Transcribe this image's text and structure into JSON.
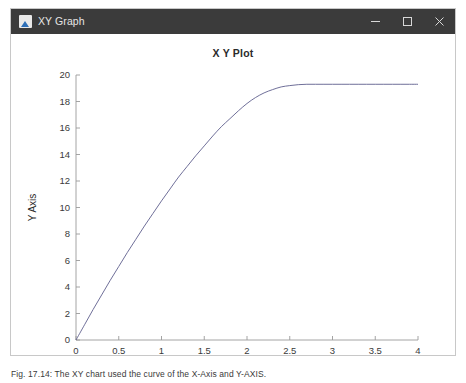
{
  "window": {
    "title": "XY Graph",
    "icon": "xy-graph-app-icon",
    "controls": [
      {
        "name": "minimize",
        "glyph": "minimize-icon"
      },
      {
        "name": "maximize",
        "glyph": "maximize-icon"
      },
      {
        "name": "close",
        "glyph": "close-icon"
      }
    ]
  },
  "colors": {
    "titlebar_bg": "#3b3b3b",
    "titlebar_text": "#e6e6e6",
    "figure_bg": "#ffffff",
    "axis": "#9a9a9a",
    "curve": "#5f5f8d",
    "text": "#2b2b2b"
  },
  "caption": {
    "text": "Fig. 17.14: The XY chart used the curve of the X-Axis and Y-AXIS."
  },
  "chart_data": {
    "type": "line",
    "title": "X Y Plot",
    "xlabel": "X Axis",
    "ylabel": "Y Axis",
    "xlim": [
      0,
      4
    ],
    "ylim": [
      0,
      20
    ],
    "xticks": [
      0,
      0.5,
      1,
      1.5,
      2,
      2.5,
      3,
      3.5,
      4
    ],
    "xtick_labels": [
      "0",
      "0.5",
      "1",
      "1.5",
      "2",
      "2.5",
      "3",
      "3.5",
      "4"
    ],
    "yticks": [
      0,
      2,
      4,
      6,
      8,
      10,
      12,
      14,
      16,
      18,
      20
    ],
    "ytick_labels": [
      "0",
      "2",
      "4",
      "6",
      "8",
      "10",
      "12",
      "14",
      "16",
      "18",
      "20"
    ],
    "grid": false,
    "legend": null,
    "series": [
      {
        "name": "curve",
        "color": "#5f5f8d",
        "x": [
          0,
          0.1,
          0.2,
          0.3,
          0.4,
          0.5,
          0.6,
          0.7,
          0.8,
          0.9,
          1.0,
          1.1,
          1.2,
          1.3,
          1.4,
          1.5,
          1.6,
          1.7,
          1.8,
          1.9,
          2.0,
          2.1,
          2.2,
          2.3,
          2.4,
          2.5,
          2.6,
          2.7,
          2.8,
          2.9,
          3.0,
          3.1,
          3.2,
          3.3,
          3.4,
          3.5,
          3.6,
          3.7,
          3.8,
          3.9,
          4.0
        ],
        "y": [
          0.0,
          1.15,
          2.3,
          3.4,
          4.5,
          5.55,
          6.6,
          7.6,
          8.6,
          9.55,
          10.5,
          11.4,
          12.3,
          13.1,
          13.9,
          14.65,
          15.4,
          16.1,
          16.7,
          17.3,
          17.85,
          18.3,
          18.65,
          18.9,
          19.1,
          19.2,
          19.27,
          19.3,
          19.3,
          19.3,
          19.3,
          19.3,
          19.3,
          19.3,
          19.3,
          19.3,
          19.3,
          19.3,
          19.3,
          19.3,
          19.3
        ]
      }
    ]
  }
}
